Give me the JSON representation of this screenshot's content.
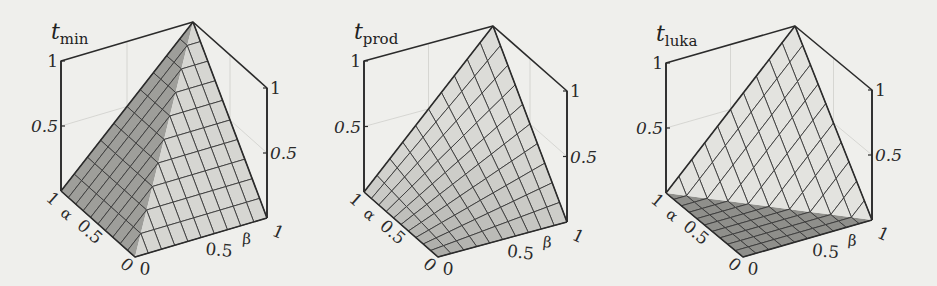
{
  "figure": {
    "background": "#efefec",
    "edge_color": "#2b2b2b",
    "grid_color": "#3a3a3a",
    "back_grid_color": "#cfcfcb"
  },
  "chart_data": [
    {
      "type": "surface3d",
      "title": "t",
      "title_sub": "min",
      "function": "min(alpha, beta)",
      "xlabel": "α",
      "ylabel": "β",
      "zlabel": "t_min",
      "x_ticks": [
        "0",
        "0.5",
        "1"
      ],
      "y_ticks": [
        "0",
        "0.5",
        "1"
      ],
      "z_ticks": [
        "0.5",
        "1"
      ],
      "xlim": [
        0,
        1
      ],
      "ylim": [
        0,
        1
      ],
      "zlim": [
        0,
        1
      ],
      "grid_divisions": 10,
      "face_colors": {
        "light": "#d6d6d2",
        "dark": "#9e9e9a"
      },
      "projection": {
        "origin": [
          135,
          257
        ],
        "a": [
          -74,
          -66
        ],
        "b": [
          132,
          -39
        ],
        "z": [
          0,
          -130
        ]
      }
    },
    {
      "type": "surface3d",
      "title": "t",
      "title_sub": "prod",
      "function": "alpha * beta",
      "xlabel": "α",
      "ylabel": "β",
      "zlabel": "t_prod",
      "x_ticks": [
        "0",
        "0.5",
        "1"
      ],
      "y_ticks": [
        "0",
        "0.5",
        "1"
      ],
      "z_ticks": [
        "0.5",
        "1"
      ],
      "xlim": [
        0,
        1
      ],
      "ylim": [
        0,
        1
      ],
      "zlim": [
        0,
        1
      ],
      "grid_divisions": 10,
      "face_colors": {
        "light": "#dcdcd8",
        "dark": "#a9a9a5"
      },
      "projection": {
        "origin": [
          438,
          257
        ],
        "a": [
          -74,
          -65
        ],
        "b": [
          129,
          -35
        ],
        "z": [
          0,
          -131
        ]
      }
    },
    {
      "type": "surface3d",
      "title": "t",
      "title_sub": "luka",
      "function": "max(0, alpha + beta - 1)",
      "xlabel": "α",
      "ylabel": "β",
      "zlabel": "t_luka",
      "x_ticks": [
        "0",
        "0.5",
        "1"
      ],
      "y_ticks": [
        "0",
        "0.5",
        "1"
      ],
      "z_ticks": [
        "0.5",
        "1"
      ],
      "xlim": [
        0,
        1
      ],
      "ylim": [
        0,
        1
      ],
      "zlim": [
        0,
        1
      ],
      "grid_divisions": 10,
      "face_colors": {
        "light": "#e3e3df",
        "dark": "#8f8f8b"
      },
      "projection": {
        "origin": [
          743,
          257
        ],
        "a": [
          -77,
          -64
        ],
        "b": [
          129,
          -37
        ],
        "z": [
          0,
          -130
        ]
      }
    }
  ]
}
